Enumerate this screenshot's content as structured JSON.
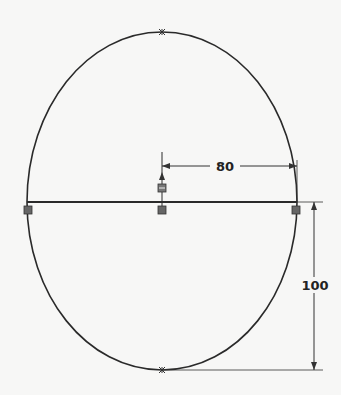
{
  "drawing": {
    "type": "sketch",
    "shape": "ellipse",
    "center": {
      "x": 162,
      "y": 202
    },
    "radius_x": 135,
    "radius_top": 170,
    "radius_bottom": 168,
    "line_color": "#2a2a2a",
    "relation_marker_color": "#555555"
  },
  "dimensions": {
    "horizontal": {
      "label": "80"
    },
    "vertical": {
      "label": "100"
    }
  }
}
